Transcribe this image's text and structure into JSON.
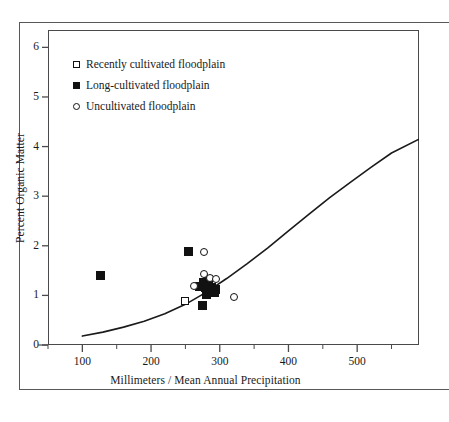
{
  "chart_data": {
    "type": "scatter",
    "title": "",
    "xlabel": "Millimeters / Mean Annual Precipitation",
    "ylabel": "Percent Organic Matter",
    "xlim": [
      50,
      590
    ],
    "ylim": [
      0,
      6.35
    ],
    "grid": false,
    "legend_position": "upper-left",
    "x_ticks": [
      100,
      200,
      300,
      400,
      500
    ],
    "x_tick_labels": [
      "100",
      "200",
      "300",
      "400",
      "500"
    ],
    "x_minor_ticks": [
      50,
      150,
      250,
      350,
      450,
      550
    ],
    "y_ticks": [
      0,
      1,
      2,
      3,
      4,
      5,
      6
    ],
    "y_tick_labels": [
      "0",
      "1",
      "2",
      "3",
      "4",
      "5",
      "6"
    ],
    "legend": [
      {
        "label": "Recently cultivated floodplain",
        "marker": "open-square"
      },
      {
        "label": "Long-cultivated floodplain",
        "marker": "filled-square"
      },
      {
        "label": "Uncultivated floodplain",
        "marker": "open-circle"
      }
    ],
    "series": [
      {
        "name": "Recently cultivated floodplain",
        "marker": "open-square",
        "points": [
          {
            "x": 250,
            "y": 0.88
          },
          {
            "x": 279,
            "y": 1.15
          }
        ]
      },
      {
        "name": "Long-cultivated floodplain",
        "marker": "filled-square",
        "points": [
          {
            "x": 126,
            "y": 1.4
          },
          {
            "x": 255,
            "y": 1.88
          },
          {
            "x": 271,
            "y": 1.18
          },
          {
            "x": 277,
            "y": 1.26
          },
          {
            "x": 283,
            "y": 1.33
          },
          {
            "x": 282,
            "y": 1.1
          },
          {
            "x": 288,
            "y": 1.16
          },
          {
            "x": 294,
            "y": 1.12
          },
          {
            "x": 292,
            "y": 1.05
          },
          {
            "x": 281,
            "y": 1.02
          },
          {
            "x": 275,
            "y": 0.8
          }
        ]
      },
      {
        "name": "Uncultivated floodplain",
        "marker": "open-circle",
        "points": [
          {
            "x": 277,
            "y": 1.88
          },
          {
            "x": 277,
            "y": 1.43
          },
          {
            "x": 286,
            "y": 1.36
          },
          {
            "x": 295,
            "y": 1.34
          },
          {
            "x": 263,
            "y": 1.19
          },
          {
            "x": 320,
            "y": 0.96
          }
        ]
      }
    ],
    "fit_curve": {
      "name": "fitted regression curve",
      "points": [
        {
          "x": 100,
          "y": 0.18
        },
        {
          "x": 130,
          "y": 0.26
        },
        {
          "x": 160,
          "y": 0.36
        },
        {
          "x": 190,
          "y": 0.48
        },
        {
          "x": 220,
          "y": 0.63
        },
        {
          "x": 250,
          "y": 0.82
        },
        {
          "x": 280,
          "y": 1.06
        },
        {
          "x": 310,
          "y": 1.34
        },
        {
          "x": 340,
          "y": 1.64
        },
        {
          "x": 370,
          "y": 1.96
        },
        {
          "x": 400,
          "y": 2.3
        },
        {
          "x": 430,
          "y": 2.64
        },
        {
          "x": 460,
          "y": 2.97
        },
        {
          "x": 490,
          "y": 3.28
        },
        {
          "x": 520,
          "y": 3.58
        },
        {
          "x": 550,
          "y": 3.87
        },
        {
          "x": 590,
          "y": 4.15
        }
      ]
    },
    "colors": {
      "marker": "#111111",
      "curve": "#1a1a1a",
      "axis": "#4a4a4c",
      "frame": "#58585a",
      "background": "#ffffff"
    }
  }
}
